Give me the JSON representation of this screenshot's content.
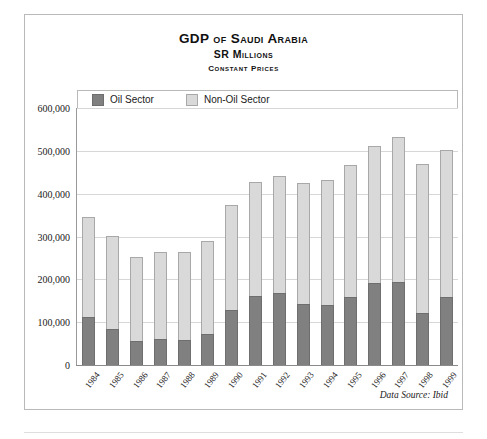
{
  "chart_data": {
    "type": "bar",
    "stacked": true,
    "title": "GDP of Saudi Arabia",
    "subtitle": "SR Millions",
    "subsubtitle": "Constant Prices",
    "xlabel": "",
    "ylabel": "",
    "ylim": [
      0,
      600000
    ],
    "ytick_step": 100000,
    "grid": true,
    "legend_position": "top-inside",
    "categories": [
      "1984",
      "1985",
      "1986",
      "1987",
      "1988",
      "1989",
      "1990",
      "1991",
      "1992",
      "1993",
      "1994",
      "1995",
      "1996",
      "1997",
      "1998",
      "1999"
    ],
    "ytick_labels": [
      "600,000",
      "500,000",
      "400,000",
      "300,000",
      "200,000",
      "100,000",
      "0"
    ],
    "ytick_values": [
      600000,
      500000,
      400000,
      300000,
      200000,
      100000,
      0
    ],
    "series": [
      {
        "name": "Oil Sector",
        "color": "#808080",
        "values": [
          113000,
          85000,
          56000,
          60000,
          59000,
          72000,
          128000,
          160000,
          168000,
          142000,
          140000,
          158000,
          192000,
          194000,
          122000,
          158000
        ]
      },
      {
        "name": "Non-Oil Sector",
        "color": "#d9d9d9",
        "values": [
          232000,
          217000,
          196000,
          203000,
          206000,
          218000,
          246000,
          267000,
          274000,
          284000,
          292000,
          309000,
          320000,
          338000,
          347000,
          344000
        ]
      }
    ],
    "totals": [
      345000,
      302000,
      252000,
      263000,
      265000,
      290000,
      374000,
      427000,
      442000,
      426000,
      432000,
      467000,
      512000,
      532000,
      469000,
      502000
    ],
    "annotations": [
      "Data Source: Ibid"
    ]
  },
  "legend": {
    "items": [
      {
        "label": "Oil Sector",
        "color": "#808080"
      },
      {
        "label": "Non-Oil Sector",
        "color": "#d9d9d9"
      }
    ]
  },
  "source_note": "Data Source: Ibid"
}
